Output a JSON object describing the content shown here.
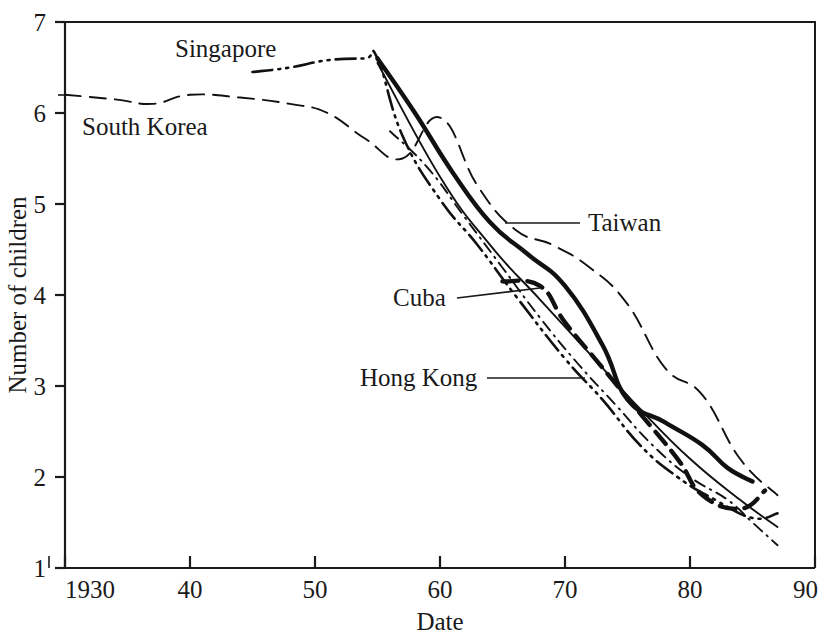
{
  "figure": {
    "background_color": "#ffffff",
    "ink_color": "#111111"
  },
  "axes": {
    "x_title": "Date",
    "y_title": "Number of children",
    "x_tick_labels": [
      "1930",
      "40",
      "50",
      "60",
      "70",
      "80",
      "90"
    ],
    "y_tick_labels": [
      "7",
      "6",
      "5",
      "4",
      "3",
      "2",
      "1"
    ]
  },
  "labels": {
    "singapore": "Singapore",
    "south_korea": "South Korea",
    "taiwan": "Taiwan",
    "cuba": "Cuba",
    "hong_kong": "Hong Kong"
  },
  "chart_data": {
    "type": "line",
    "title": "",
    "subtitle": "",
    "xlabel": "Date",
    "ylabel": "Number of children",
    "xlim": [
      1930,
      1990
    ],
    "ylim": [
      1,
      7
    ],
    "xticks": [
      1930,
      1940,
      1950,
      1960,
      1970,
      1980,
      1990
    ],
    "yticks": [
      1,
      2,
      3,
      4,
      5,
      6,
      7
    ],
    "grid": false,
    "legend": "inline-annotations",
    "annotations": [
      {
        "text": "Singapore",
        "x": 1943,
        "y": 6.83,
        "anchor": "series-singapore"
      },
      {
        "text": "South Korea",
        "x": 1931,
        "y": 5.95,
        "anchor": "series-south-korea"
      },
      {
        "text": "Taiwan",
        "x": 1974,
        "y": 4.78,
        "anchor": "series-taiwan"
      },
      {
        "text": "Cuba",
        "x": 1960,
        "y": 3.95,
        "anchor": "series-cuba"
      },
      {
        "text": "Hong Kong",
        "x": 1957,
        "y": 3.2,
        "anchor": "series-hong-kong"
      }
    ],
    "series": [
      {
        "name": "South Korea",
        "style": "dashed",
        "width": "thin",
        "x": [
          1930,
          1934,
          1937,
          1940,
          1944,
          1948,
          1951,
          1954,
          1957,
          1960,
          1963,
          1966,
          1969,
          1972,
          1975,
          1978,
          1981,
          1984,
          1987
        ],
        "values": [
          6.2,
          6.15,
          6.1,
          6.2,
          6.17,
          6.1,
          6.0,
          5.72,
          5.5,
          5.95,
          5.2,
          4.72,
          4.55,
          4.3,
          3.9,
          3.2,
          2.9,
          2.2,
          1.8
        ]
      },
      {
        "name": "Singapore",
        "style": "dash-dot-dot",
        "width": "medium",
        "x": [
          1945,
          1948,
          1951,
          1954,
          1955,
          1957,
          1960,
          1963,
          1966,
          1970,
          1973,
          1976,
          1979,
          1982,
          1985,
          1987
        ],
        "values": [
          6.45,
          6.5,
          6.58,
          6.6,
          6.6,
          5.75,
          5.05,
          4.55,
          4.0,
          3.3,
          2.85,
          2.35,
          2.0,
          1.75,
          1.55,
          1.6
        ]
      },
      {
        "name": "Taiwan",
        "style": "solid",
        "width": "thick",
        "x": [
          1955,
          1958,
          1961,
          1964,
          1967,
          1970,
          1973,
          1975,
          1978,
          1981,
          1983,
          1985
        ],
        "values": [
          6.6,
          6.0,
          5.35,
          4.8,
          4.45,
          4.1,
          3.45,
          2.85,
          2.6,
          2.35,
          2.1,
          1.95
        ]
      },
      {
        "name": "Cuba",
        "style": "dashed",
        "width": "thick",
        "x": [
          1965,
          1968,
          1970,
          1973,
          1976,
          1979,
          1981,
          1984,
          1986
        ],
        "values": [
          4.15,
          4.1,
          3.7,
          3.2,
          2.7,
          2.2,
          1.8,
          1.65,
          1.85
        ]
      },
      {
        "name": "Hong Kong",
        "style": "dash-dot",
        "width": "thin",
        "x": [
          1956,
          1959,
          1962,
          1965,
          1968,
          1971,
          1974,
          1977,
          1980,
          1983,
          1985,
          1987
        ],
        "values": [
          5.8,
          5.4,
          4.85,
          4.3,
          3.75,
          3.25,
          2.8,
          2.35,
          2.0,
          1.75,
          1.5,
          1.25
        ]
      },
      {
        "name": "Taiwan-secondary-thin",
        "style": "solid",
        "width": "thin",
        "x": [
          1955,
          1960,
          1964,
          1968,
          1972,
          1976,
          1980,
          1984,
          1987
        ],
        "values": [
          6.55,
          5.3,
          4.55,
          3.95,
          3.35,
          2.75,
          2.2,
          1.75,
          1.45
        ]
      }
    ]
  }
}
